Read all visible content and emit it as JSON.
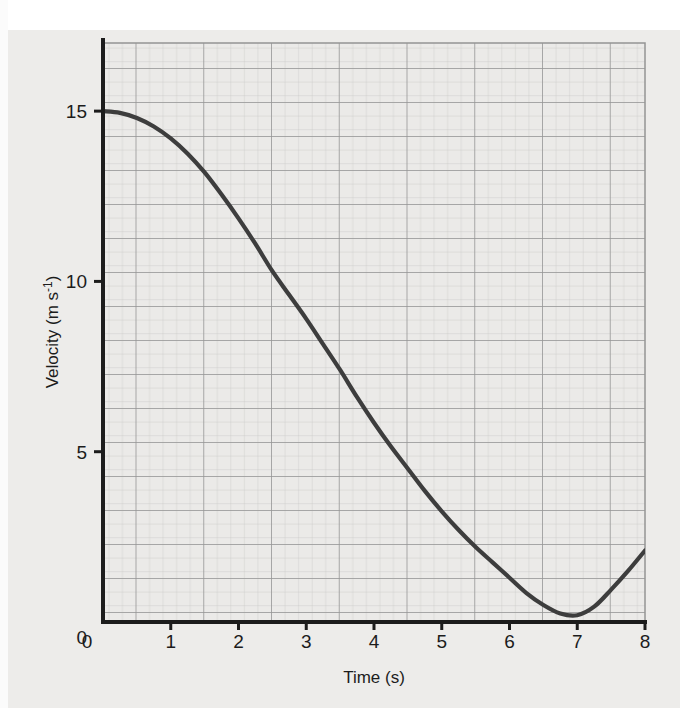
{
  "figure": {
    "kind": "velocity-time-graph",
    "background_color": "#edecea",
    "grid_color_major": "#9a9a9a",
    "grid_color_minor": "#c9c9c9",
    "axis_color": "#1c1c1c",
    "curve_color": "#3d3d3d"
  },
  "chart_data": {
    "type": "line",
    "title": "",
    "xlabel": "Time (s)",
    "ylabel": "Velocity (m s⁻¹)",
    "ylabel_main": "Velocity (m s",
    "ylabel_sup": "-1",
    "ylabel_close": ")",
    "xlim": [
      0,
      8
    ],
    "ylim": [
      0,
      17
    ],
    "xticks": [
      "0",
      "1",
      "2",
      "3",
      "4",
      "5",
      "6",
      "7",
      "8"
    ],
    "xtick_values": [
      0,
      1,
      2,
      3,
      4,
      5,
      6,
      7,
      8
    ],
    "yticks": [
      "0",
      "5",
      "10",
      "15"
    ],
    "ytick_values": [
      0,
      5,
      10,
      15
    ],
    "grid": true,
    "grid_major_step_x": 1,
    "grid_major_step_y": 1,
    "grid_minor_divisions": 5,
    "legend": null,
    "series": [
      {
        "name": "velocity",
        "x": [
          0.0,
          0.25,
          0.5,
          0.75,
          1.0,
          1.25,
          1.5,
          1.75,
          2.0,
          2.25,
          2.5,
          2.75,
          3.0,
          3.25,
          3.5,
          3.75,
          4.0,
          4.25,
          4.5,
          4.75,
          5.0,
          5.25,
          5.5,
          5.75,
          6.0,
          6.25,
          6.5,
          6.75,
          7.0,
          7.25,
          7.5,
          7.75,
          8.0
        ],
        "y": [
          15.0,
          14.95,
          14.8,
          14.55,
          14.2,
          13.75,
          13.2,
          12.55,
          11.85,
          11.1,
          10.3,
          9.6,
          8.9,
          8.15,
          7.4,
          6.6,
          5.85,
          5.15,
          4.5,
          3.85,
          3.25,
          2.7,
          2.2,
          1.75,
          1.3,
          0.85,
          0.5,
          0.25,
          0.2,
          0.45,
          0.95,
          1.5,
          2.1
        ]
      }
    ],
    "annotations": {
      "start_point": {
        "t": 0,
        "v": 15
      },
      "minimum_point": {
        "t": 6.7,
        "v": 0.2
      },
      "end_point": {
        "t": 8,
        "v": 2.1
      }
    }
  },
  "page": {
    "bleed_text": ""
  }
}
